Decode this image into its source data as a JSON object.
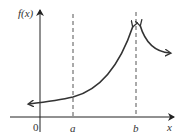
{
  "figure": {
    "y_axis_label": "f(x)",
    "x_axis_label": "x",
    "origin_label": "0",
    "asymptote_a_label": "a",
    "asymptote_b_label": "b",
    "colors": {
      "axis": "#222222",
      "curve": "#333333",
      "dashed": "#555555",
      "text": "#333333"
    }
  }
}
